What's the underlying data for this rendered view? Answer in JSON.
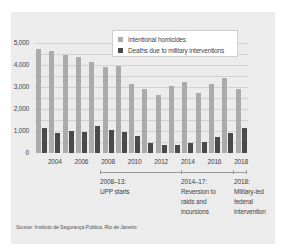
{
  "chart_data": {
    "type": "bar",
    "title": "",
    "xlabel": "",
    "ylabel": "",
    "ylim": [
      0,
      5000
    ],
    "yticks": [
      "5,000",
      "4,000",
      "3,000",
      "2,000",
      "1,000",
      "0"
    ],
    "xtick_labels": [
      "2004",
      "2006",
      "2008",
      "2010",
      "2012",
      "2014",
      "2016",
      "2018"
    ],
    "categories": [
      "2003",
      "2004",
      "2005",
      "2006",
      "2007",
      "2008",
      "2009",
      "2010",
      "2011",
      "2012",
      "2013",
      "2014",
      "2015",
      "2016",
      "2017",
      "2018"
    ],
    "series": [
      {
        "name": "Intentional homicides",
        "color": "#ababab",
        "values": [
          4750,
          4650,
          4450,
          4350,
          4150,
          3900,
          3950,
          3150,
          2900,
          2650,
          3050,
          3250,
          2750,
          3150,
          3400,
          2900
        ]
      },
      {
        "name": "Deaths due to military interventions",
        "color": "#4a4a4a",
        "values": [
          1140,
          910,
          980,
          970,
          1240,
          1040,
          970,
          790,
          450,
          380,
          360,
          470,
          500,
          710,
          910,
          1140
        ]
      }
    ],
    "grid": true,
    "legend_position": "top-right",
    "annotations": [
      {
        "period": "2008–13:",
        "text": [
          "UPP starts"
        ]
      },
      {
        "period": "2014–17:",
        "text": [
          "Reversion to",
          "raids and",
          "incursions"
        ]
      },
      {
        "period": "2018:",
        "text": [
          "Military-led",
          "federal",
          "intervention"
        ]
      }
    ],
    "source": "Source: Instituto de Segurança Pública, Rio de Janeiro"
  },
  "legend": {
    "items": [
      {
        "label": "Intentional homicides",
        "color": "#ababab"
      },
      {
        "label": "Deaths due to military interventions",
        "color": "#4a4a4a"
      }
    ]
  },
  "annotations": {
    "a1": {
      "l1": "2008–13:",
      "l2": "UPP starts"
    },
    "a2": {
      "l1": "2014–17:",
      "l2": "Reversion to",
      "l3": "raids and",
      "l4": "incursions"
    },
    "a3": {
      "l1": "2018:",
      "l2": "Military-led",
      "l3": "federal",
      "l4": "intervention"
    }
  },
  "source": "Source: Instituto de Segurança Pública, Rio de Janeiro"
}
